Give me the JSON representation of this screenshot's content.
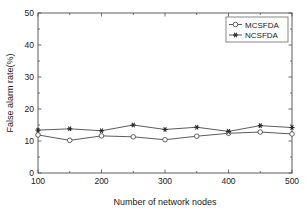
{
  "chart_data": {
    "type": "line",
    "title": "",
    "xlabel": "Number of network nodes",
    "ylabel": "False alarm rate(%)",
    "x": [
      100,
      150,
      200,
      250,
      300,
      350,
      400,
      450,
      500
    ],
    "xlim": [
      100,
      500
    ],
    "ylim": [
      0,
      50
    ],
    "xticks": [
      100,
      200,
      300,
      400,
      500
    ],
    "yticks": [
      0,
      10,
      20,
      30,
      40,
      50
    ],
    "xtick_labels": [
      "100",
      "200",
      "300",
      "400",
      "500"
    ],
    "ytick_labels": [
      "0",
      "10",
      "20",
      "30",
      "40",
      "50"
    ],
    "grid": false,
    "legend_position": "upper right",
    "series": [
      {
        "name": "MCSFDA",
        "marker": "open-circle",
        "color": "#4a4a4a",
        "values": [
          11.9,
          10.2,
          11.6,
          11.3,
          10.4,
          11.5,
          12.4,
          12.8,
          12.2
        ]
      },
      {
        "name": "NCSFDA",
        "marker": "filled-star",
        "color": "#2b2b2b",
        "values": [
          13.4,
          13.8,
          13.2,
          15.0,
          13.6,
          14.3,
          13.0,
          14.8,
          14.2
        ]
      }
    ]
  },
  "legend": {
    "entries": [
      {
        "label": "MCSFDA"
      },
      {
        "label": "NCSFDA"
      }
    ]
  }
}
